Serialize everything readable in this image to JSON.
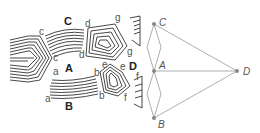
{
  "figure": {
    "left_panel": {
      "description": "Schematic of lamellar grains separated by boundaries",
      "region_labels": [
        "A",
        "B",
        "C",
        "D"
      ],
      "boundary_labels": [
        {
          "text": "c",
          "x": 40,
          "y": 34
        },
        {
          "text": "c",
          "x": 53,
          "y": 60
        },
        {
          "text": "C",
          "x": 67,
          "y": 24
        },
        {
          "text": "d",
          "x": 86,
          "y": 26
        },
        {
          "text": "d",
          "x": 79,
          "y": 57
        },
        {
          "text": "g",
          "x": 116,
          "y": 21
        },
        {
          "text": "g",
          "x": 127,
          "y": 54
        },
        {
          "text": "A",
          "x": 66,
          "y": 70
        },
        {
          "text": "a",
          "x": 53,
          "y": 74
        },
        {
          "text": "a",
          "x": 46,
          "y": 101
        },
        {
          "text": "b",
          "x": 94,
          "y": 75
        },
        {
          "text": "b",
          "x": 99,
          "y": 98
        },
        {
          "text": "e",
          "x": 102,
          "y": 67
        },
        {
          "text": "e",
          "x": 121,
          "y": 69
        },
        {
          "text": "D",
          "x": 130,
          "y": 69
        },
        {
          "text": "f",
          "x": 124,
          "y": 100
        },
        {
          "text": "f",
          "x": 135,
          "y": 80
        },
        {
          "text": "B",
          "x": 66,
          "y": 109
        }
      ]
    },
    "right_panel": {
      "description": "Graph connecting grain nodes",
      "nodes": [
        {
          "id": "C",
          "label": "C",
          "x": 154,
          "y": 24
        },
        {
          "id": "A",
          "label": "A",
          "x": 154,
          "y": 71
        },
        {
          "id": "B",
          "label": "B",
          "x": 154,
          "y": 118
        },
        {
          "id": "D",
          "label": "D",
          "x": 237,
          "y": 71
        }
      ],
      "edges": [
        [
          "C",
          "D"
        ],
        [
          "A",
          "D"
        ],
        [
          "B",
          "D"
        ],
        [
          "C",
          "A"
        ],
        [
          "A",
          "B"
        ]
      ]
    }
  }
}
